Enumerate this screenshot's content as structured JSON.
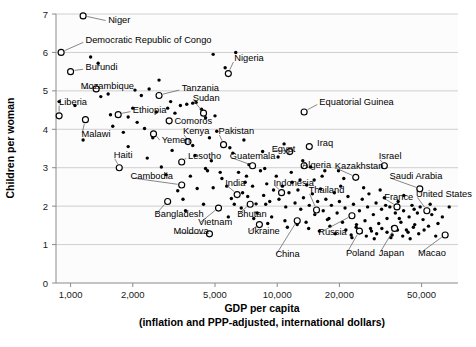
{
  "chart_data": {
    "type": "scatter",
    "title": "",
    "xlabel": "GDP per capita",
    "xlabel_line2": "(inflation and PPP-adjusted, international dollars)",
    "ylabel": "Children per woman",
    "xscale": "log",
    "xlim": [
      850,
      75000
    ],
    "ylim": [
      0,
      7
    ],
    "grid": true,
    "legend": "none",
    "xticks": [
      1000,
      2000,
      5000,
      10000,
      20000,
      50000
    ],
    "xtick_labels": [
      "1,000",
      "2,000",
      "5,000",
      "10,000",
      "20,000",
      "50,000"
    ],
    "yticks": [
      0,
      1,
      2,
      3,
      4,
      5,
      6,
      7
    ],
    "ytick_labels": [
      "0",
      "1",
      "2",
      "3",
      "4",
      "5",
      "6",
      "7"
    ],
    "marker_open_meaning": "labeled country",
    "marker_dot_meaning": "unlabeled country",
    "labeled_points": [
      {
        "name": "Niger",
        "x": 1150,
        "y": 6.95,
        "lx": 1520,
        "ly": 6.86,
        "anchor": "start"
      },
      {
        "name": "Democratic Republic of Congo",
        "x": 900,
        "y": 6.0,
        "lx": 1180,
        "ly": 6.33,
        "anchor": "start"
      },
      {
        "name": "Burundi",
        "x": 1000,
        "y": 5.5,
        "lx": 1180,
        "ly": 5.62,
        "anchor": "start"
      },
      {
        "name": "Mozambique",
        "x": 1330,
        "y": 5.05,
        "lx": 1120,
        "ly": 5.12,
        "anchor": "start"
      },
      {
        "name": "Nigeria",
        "x": 5800,
        "y": 5.45,
        "lx": 6200,
        "ly": 5.85,
        "anchor": "start"
      },
      {
        "name": "Tanzania",
        "x": 2680,
        "y": 4.88,
        "lx": 3450,
        "ly": 5.08,
        "anchor": "start"
      },
      {
        "name": "Liberia",
        "x": 880,
        "y": 4.35,
        "lx": 880,
        "ly": 4.72,
        "anchor": "start"
      },
      {
        "name": "Ethiopia",
        "x": 1700,
        "y": 4.38,
        "lx": 2000,
        "ly": 4.52,
        "anchor": "start"
      },
      {
        "name": "Sudan",
        "x": 4400,
        "y": 4.42,
        "lx": 3900,
        "ly": 4.82,
        "anchor": "start"
      },
      {
        "name": "Comoros",
        "x": 3000,
        "y": 4.22,
        "lx": 3180,
        "ly": 4.22,
        "anchor": "start"
      },
      {
        "name": "Equatorial Guinea",
        "x": 13500,
        "y": 4.45,
        "lx": 16000,
        "ly": 4.72,
        "anchor": "start"
      },
      {
        "name": "Malawi",
        "x": 1180,
        "y": 4.25,
        "lx": 1130,
        "ly": 3.88,
        "anchor": "start"
      },
      {
        "name": "Yemen",
        "x": 2520,
        "y": 3.88,
        "lx": 2760,
        "ly": 3.72,
        "anchor": "start"
      },
      {
        "name": "Kenya",
        "x": 3700,
        "y": 3.68,
        "lx": 3500,
        "ly": 3.95,
        "anchor": "start"
      },
      {
        "name": "Pakistan",
        "x": 5500,
        "y": 3.6,
        "lx": 5200,
        "ly": 3.95,
        "anchor": "start"
      },
      {
        "name": "Egypt",
        "x": 11500,
        "y": 3.42,
        "lx": 9400,
        "ly": 3.5,
        "anchor": "start"
      },
      {
        "name": "Iraq",
        "x": 14300,
        "y": 3.55,
        "lx": 15600,
        "ly": 3.66,
        "anchor": "start"
      },
      {
        "name": "Haiti",
        "x": 1720,
        "y": 3.0,
        "lx": 1620,
        "ly": 3.33,
        "anchor": "start"
      },
      {
        "name": "Lesotho",
        "x": 3450,
        "y": 3.15,
        "lx": 3700,
        "ly": 3.32,
        "anchor": "start"
      },
      {
        "name": "Guatemala",
        "x": 7600,
        "y": 3.05,
        "lx": 5900,
        "ly": 3.32,
        "anchor": "start"
      },
      {
        "name": "Algeria",
        "x": 13500,
        "y": 3.05,
        "lx": 13200,
        "ly": 3.08,
        "anchor": "start"
      },
      {
        "name": "Kazakhstan",
        "x": 24000,
        "y": 2.75,
        "lx": 19000,
        "ly": 3.05,
        "anchor": "start"
      },
      {
        "name": "Israel",
        "x": 33000,
        "y": 3.05,
        "lx": 31000,
        "ly": 3.3,
        "anchor": "start"
      },
      {
        "name": "Cambodia",
        "x": 3450,
        "y": 2.55,
        "lx": 1950,
        "ly": 2.78,
        "anchor": "start"
      },
      {
        "name": "India",
        "x": 6400,
        "y": 2.3,
        "lx": 5600,
        "ly": 2.62,
        "anchor": "start"
      },
      {
        "name": "Indonesia",
        "x": 10500,
        "y": 2.35,
        "lx": 9600,
        "ly": 2.62,
        "anchor": "start"
      },
      {
        "name": "Thailand",
        "x": 15500,
        "y": 1.9,
        "lx": 14200,
        "ly": 2.42,
        "anchor": "start"
      },
      {
        "name": "Saudi Arabia",
        "x": 49000,
        "y": 2.45,
        "lx": 35000,
        "ly": 2.78,
        "anchor": "start"
      },
      {
        "name": "France",
        "x": 38000,
        "y": 1.98,
        "lx": 33000,
        "ly": 2.25,
        "anchor": "start"
      },
      {
        "name": "United States",
        "x": 53000,
        "y": 1.88,
        "lx": 47000,
        "ly": 2.32,
        "anchor": "start"
      },
      {
        "name": "Bangladesh",
        "x": 2950,
        "y": 2.12,
        "lx": 2550,
        "ly": 1.8,
        "anchor": "start"
      },
      {
        "name": "Bhutan",
        "x": 7400,
        "y": 2.05,
        "lx": 6400,
        "ly": 1.8,
        "anchor": "start"
      },
      {
        "name": "Vietnam",
        "x": 5200,
        "y": 1.95,
        "lx": 4150,
        "ly": 1.58,
        "anchor": "start"
      },
      {
        "name": "Ukraine",
        "x": 8200,
        "y": 1.52,
        "lx": 7200,
        "ly": 1.35,
        "anchor": "start"
      },
      {
        "name": "Moldova",
        "x": 4700,
        "y": 1.28,
        "lx": 3150,
        "ly": 1.35,
        "anchor": "start"
      },
      {
        "name": "China",
        "x": 12500,
        "y": 1.62,
        "lx": 9800,
        "ly": 0.75,
        "anchor": "start"
      },
      {
        "name": "Russia",
        "x": 23000,
        "y": 1.75,
        "lx": 15800,
        "ly": 1.33,
        "anchor": "start"
      },
      {
        "name": "Poland",
        "x": 25000,
        "y": 1.35,
        "lx": 21500,
        "ly": 0.78,
        "anchor": "start"
      },
      {
        "name": "Japan",
        "x": 37000,
        "y": 1.42,
        "lx": 31000,
        "ly": 0.78,
        "anchor": "start"
      },
      {
        "name": "Macao",
        "x": 65000,
        "y": 1.25,
        "lx": 48000,
        "ly": 0.78,
        "anchor": "start"
      }
    ],
    "unlabeled_points": [
      {
        "x": 880,
        "y": 4.72
      },
      {
        "x": 1360,
        "y": 5.72
      },
      {
        "x": 1520,
        "y": 4.92
      },
      {
        "x": 1600,
        "y": 4.08
      },
      {
        "x": 1560,
        "y": 4.38
      },
      {
        "x": 1900,
        "y": 4.32
      },
      {
        "x": 2000,
        "y": 4.55
      },
      {
        "x": 2100,
        "y": 4.18
      },
      {
        "x": 2280,
        "y": 4.02
      },
      {
        "x": 2400,
        "y": 5.05
      },
      {
        "x": 2500,
        "y": 3.78
      },
      {
        "x": 2680,
        "y": 5.28
      },
      {
        "x": 2950,
        "y": 4.55
      },
      {
        "x": 3050,
        "y": 4.72
      },
      {
        "x": 3200,
        "y": 4.42
      },
      {
        "x": 3400,
        "y": 4.62
      },
      {
        "x": 3650,
        "y": 4.65
      },
      {
        "x": 3900,
        "y": 4.68
      },
      {
        "x": 4050,
        "y": 4.7
      },
      {
        "x": 4300,
        "y": 4.52
      },
      {
        "x": 4500,
        "y": 4.3
      },
      {
        "x": 4700,
        "y": 3.78
      },
      {
        "x": 5100,
        "y": 3.95
      },
      {
        "x": 5600,
        "y": 5.6
      },
      {
        "x": 5900,
        "y": 3.52
      },
      {
        "x": 6300,
        "y": 6.0
      },
      {
        "x": 2900,
        "y": 2.82
      },
      {
        "x": 3300,
        "y": 2.4
      },
      {
        "x": 3800,
        "y": 2.78
      },
      {
        "x": 4100,
        "y": 2.46
      },
      {
        "x": 4600,
        "y": 2.92
      },
      {
        "x": 4900,
        "y": 2.48
      },
      {
        "x": 5300,
        "y": 2.88
      },
      {
        "x": 5700,
        "y": 2.52
      },
      {
        "x": 6000,
        "y": 2.2
      },
      {
        "x": 6500,
        "y": 2.88
      },
      {
        "x": 6800,
        "y": 2.35
      },
      {
        "x": 7000,
        "y": 2.62
      },
      {
        "x": 7200,
        "y": 2.25
      },
      {
        "x": 7600,
        "y": 2.52
      },
      {
        "x": 7900,
        "y": 2.06
      },
      {
        "x": 8300,
        "y": 2.92
      },
      {
        "x": 8600,
        "y": 2.28
      },
      {
        "x": 8900,
        "y": 2.58
      },
      {
        "x": 9200,
        "y": 2.12
      },
      {
        "x": 9600,
        "y": 2.42
      },
      {
        "x": 9900,
        "y": 2.78
      },
      {
        "x": 10200,
        "y": 2.18
      },
      {
        "x": 10600,
        "y": 2.52
      },
      {
        "x": 11000,
        "y": 1.98
      },
      {
        "x": 11400,
        "y": 2.35
      },
      {
        "x": 11800,
        "y": 2.62
      },
      {
        "x": 12200,
        "y": 2.08
      },
      {
        "x": 12600,
        "y": 2.42
      },
      {
        "x": 13000,
        "y": 1.92
      },
      {
        "x": 13400,
        "y": 2.22
      },
      {
        "x": 13900,
        "y": 2.55
      },
      {
        "x": 14300,
        "y": 2.02
      },
      {
        "x": 14800,
        "y": 2.32
      },
      {
        "x": 15200,
        "y": 1.78
      },
      {
        "x": 15700,
        "y": 2.12
      },
      {
        "x": 16200,
        "y": 2.45
      },
      {
        "x": 16700,
        "y": 1.88
      },
      {
        "x": 17200,
        "y": 2.18
      },
      {
        "x": 17800,
        "y": 1.68
      },
      {
        "x": 18300,
        "y": 2.02
      },
      {
        "x": 18900,
        "y": 2.35
      },
      {
        "x": 19500,
        "y": 1.82
      },
      {
        "x": 20000,
        "y": 2.12
      },
      {
        "x": 20700,
        "y": 1.58
      },
      {
        "x": 21300,
        "y": 1.95
      },
      {
        "x": 22000,
        "y": 2.25
      },
      {
        "x": 22700,
        "y": 1.72
      },
      {
        "x": 23400,
        "y": 2.05
      },
      {
        "x": 24200,
        "y": 1.52
      },
      {
        "x": 25000,
        "y": 1.88
      },
      {
        "x": 25800,
        "y": 2.18
      },
      {
        "x": 26600,
        "y": 1.62
      },
      {
        "x": 27400,
        "y": 1.98
      },
      {
        "x": 28300,
        "y": 1.42
      },
      {
        "x": 29200,
        "y": 1.78
      },
      {
        "x": 30100,
        "y": 2.08
      },
      {
        "x": 31000,
        "y": 1.55
      },
      {
        "x": 32000,
        "y": 1.92
      },
      {
        "x": 33000,
        "y": 2.22
      },
      {
        "x": 34000,
        "y": 1.68
      },
      {
        "x": 35100,
        "y": 1.98
      },
      {
        "x": 36200,
        "y": 1.45
      },
      {
        "x": 37300,
        "y": 1.82
      },
      {
        "x": 38500,
        "y": 2.12
      },
      {
        "x": 39700,
        "y": 1.58
      },
      {
        "x": 40900,
        "y": 1.88
      },
      {
        "x": 42200,
        "y": 1.38
      },
      {
        "x": 43500,
        "y": 1.72
      },
      {
        "x": 44900,
        "y": 2.02
      },
      {
        "x": 46300,
        "y": 1.52
      },
      {
        "x": 47700,
        "y": 1.82
      },
      {
        "x": 49200,
        "y": 1.98
      },
      {
        "x": 50800,
        "y": 1.65
      },
      {
        "x": 52400,
        "y": 1.85
      },
      {
        "x": 54000,
        "y": 1.48
      },
      {
        "x": 56000,
        "y": 1.78
      },
      {
        "x": 58000,
        "y": 1.92
      },
      {
        "x": 60000,
        "y": 1.55
      },
      {
        "x": 63000,
        "y": 1.72
      },
      {
        "x": 1150,
        "y": 3.72
      },
      {
        "x": 1400,
        "y": 4.85
      },
      {
        "x": 1800,
        "y": 3.92
      },
      {
        "x": 2200,
        "y": 4.88
      },
      {
        "x": 2600,
        "y": 4.45
      },
      {
        "x": 3100,
        "y": 3.45
      },
      {
        "x": 3500,
        "y": 2.18
      },
      {
        "x": 4000,
        "y": 3.32
      },
      {
        "x": 4400,
        "y": 2.05
      },
      {
        "x": 4800,
        "y": 3.18
      },
      {
        "x": 5400,
        "y": 2.72
      },
      {
        "x": 6100,
        "y": 3.38
      },
      {
        "x": 6700,
        "y": 1.95
      },
      {
        "x": 7300,
        "y": 3.08
      },
      {
        "x": 8000,
        "y": 1.82
      },
      {
        "x": 8700,
        "y": 2.98
      },
      {
        "x": 9400,
        "y": 1.72
      },
      {
        "x": 10100,
        "y": 3.28
      },
      {
        "x": 10900,
        "y": 1.62
      },
      {
        "x": 11700,
        "y": 2.88
      },
      {
        "x": 12500,
        "y": 1.52
      },
      {
        "x": 13300,
        "y": 3.18
      },
      {
        "x": 14200,
        "y": 1.42
      },
      {
        "x": 15100,
        "y": 2.68
      },
      {
        "x": 16000,
        "y": 1.35
      },
      {
        "x": 17000,
        "y": 2.92
      },
      {
        "x": 18000,
        "y": 1.48
      },
      {
        "x": 19100,
        "y": 1.28
      },
      {
        "x": 20300,
        "y": 2.52
      },
      {
        "x": 21500,
        "y": 1.38
      },
      {
        "x": 22800,
        "y": 1.25
      },
      {
        "x": 24100,
        "y": 1.45
      },
      {
        "x": 25500,
        "y": 1.32
      },
      {
        "x": 27000,
        "y": 1.22
      },
      {
        "x": 28600,
        "y": 1.35
      },
      {
        "x": 30300,
        "y": 1.28
      },
      {
        "x": 32100,
        "y": 1.42
      },
      {
        "x": 34000,
        "y": 1.32
      },
      {
        "x": 36000,
        "y": 1.25
      },
      {
        "x": 38200,
        "y": 1.38
      },
      {
        "x": 40500,
        "y": 1.22
      },
      {
        "x": 43000,
        "y": 1.32
      },
      {
        "x": 45600,
        "y": 1.45
      },
      {
        "x": 48400,
        "y": 1.28
      },
      {
        "x": 51400,
        "y": 1.38
      },
      {
        "x": 1250,
        "y": 5.88
      },
      {
        "x": 2050,
        "y": 5.02
      },
      {
        "x": 4900,
        "y": 5.95
      },
      {
        "x": 1050,
        "y": 4.62
      },
      {
        "x": 1900,
        "y": 3.55
      },
      {
        "x": 2350,
        "y": 3.25
      },
      {
        "x": 5000,
        "y": 4.35
      },
      {
        "x": 6900,
        "y": 3.72
      },
      {
        "x": 8500,
        "y": 3.42
      },
      {
        "x": 10800,
        "y": 3.62
      },
      {
        "x": 12900,
        "y": 2.68
      },
      {
        "x": 16500,
        "y": 2.78
      },
      {
        "x": 21000,
        "y": 2.72
      },
      {
        "x": 26200,
        "y": 2.48
      },
      {
        "x": 31500,
        "y": 2.42
      },
      {
        "x": 41000,
        "y": 2.28
      },
      {
        "x": 55000,
        "y": 2.05
      },
      {
        "x": 68000,
        "y": 1.98
      },
      {
        "x": 3600,
        "y": 1.88
      },
      {
        "x": 5800,
        "y": 1.72
      },
      {
        "x": 7700,
        "y": 1.68
      },
      {
        "x": 9000,
        "y": 1.55
      },
      {
        "x": 11200,
        "y": 1.45
      },
      {
        "x": 13800,
        "y": 1.58
      },
      {
        "x": 17500,
        "y": 1.65
      },
      {
        "x": 23000,
        "y": 1.18
      },
      {
        "x": 29500,
        "y": 1.15
      },
      {
        "x": 35500,
        "y": 1.18
      },
      {
        "x": 44000,
        "y": 1.15
      },
      {
        "x": 58500,
        "y": 1.22
      },
      {
        "x": 2750,
        "y": 3.02
      },
      {
        "x": 3900,
        "y": 3.58
      },
      {
        "x": 4500,
        "y": 2.98
      },
      {
        "x": 6200,
        "y": 2.05
      },
      {
        "x": 7100,
        "y": 2.78
      },
      {
        "x": 8800,
        "y": 2.05
      },
      {
        "x": 14500,
        "y": 3.02
      },
      {
        "x": 19800,
        "y": 2.92
      },
      {
        "x": 27800,
        "y": 2.32
      },
      {
        "x": 33500,
        "y": 2.02
      },
      {
        "x": 39000,
        "y": 1.68
      },
      {
        "x": 46000,
        "y": 1.92
      }
    ]
  },
  "figure": {
    "ylabel": "Children per woman",
    "xlabel_main": "GDP per capita",
    "xlabel_sub": "(inflation and PPP-adjusted, international dollars)"
  },
  "colors": {
    "background": "#ffffff",
    "plot_background": "#fcfcfc",
    "gridline": "#c9c9c9",
    "axis": "#8a8a8a",
    "marker": "#000000",
    "text": "#000000",
    "leader": "#555555"
  }
}
